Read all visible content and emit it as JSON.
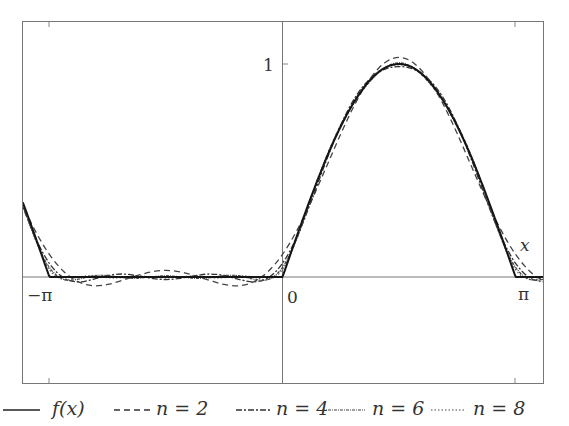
{
  "chart_data": {
    "type": "line",
    "title": "",
    "xlabel": "x",
    "ylabel": "",
    "function": "f(x) = max(sin x, 0) (half-wave rectified sine), Fourier partial sums S_n",
    "xlim": [
      -3.5,
      3.53
    ],
    "ylim": [
      -0.5,
      1.2
    ],
    "grid": false,
    "legend_position": "bottom",
    "x_ticks": [
      {
        "value": -3.14159,
        "label": "−π"
      },
      {
        "value": 0,
        "label": "0"
      },
      {
        "value": 3.14159,
        "label": "π"
      }
    ],
    "y_ticks": [
      {
        "value": 1,
        "label": "1"
      }
    ],
    "x": [
      -3.5343,
      -3.3379,
      -3.1416,
      -2.9452,
      -2.7489,
      -2.5525,
      -2.3562,
      -2.1598,
      -1.9635,
      -1.7671,
      -1.5708,
      -1.3744,
      -1.1781,
      -0.9817,
      -0.7854,
      -0.589,
      -0.3927,
      -0.1963,
      0,
      0.1963,
      0.3927,
      0.589,
      0.7854,
      0.9817,
      1.1781,
      1.3744,
      1.5708,
      1.7671,
      1.9635,
      2.1598,
      2.3562,
      2.5525,
      2.7489,
      2.9452,
      3.1416,
      3.3379,
      3.5343
    ],
    "series": [
      {
        "name": "f(x)",
        "style": "solid",
        "values": [
          0.383,
          0.195,
          0,
          0,
          0,
          0,
          0,
          0,
          0,
          0,
          0,
          0,
          0,
          0,
          0,
          0,
          0,
          0,
          0,
          0.195,
          0.383,
          0.556,
          0.707,
          0.831,
          0.924,
          0.981,
          1.0,
          0.981,
          0.924,
          0.831,
          0.707,
          0.556,
          0.383,
          0.195,
          0,
          0,
          0
        ]
      },
      {
        "name": "n = 2",
        "style": "dashed",
        "values": [
          0.36,
          0.22,
          0.106,
          0.025,
          -0.023,
          -0.041,
          -0.035,
          -0.016,
          0.006,
          0.024,
          0.031,
          0.024,
          0.006,
          -0.016,
          -0.035,
          -0.041,
          -0.023,
          0.025,
          0.106,
          0.22,
          0.36,
          0.515,
          0.672,
          0.815,
          0.93,
          1.005,
          1.031,
          1.005,
          0.93,
          0.815,
          0.672,
          0.515,
          0.36,
          0.22,
          0.106,
          0.025,
          -0.023
        ]
      },
      {
        "name": "n = 4",
        "style": "dash-dot",
        "values": [
          0.36,
          0.19,
          0.064,
          -0.005,
          -0.023,
          -0.011,
          0.007,
          0.014,
          0.006,
          -0.006,
          -0.012,
          -0.006,
          0.006,
          0.014,
          0.007,
          -0.011,
          -0.023,
          -0.005,
          0.064,
          0.19,
          0.36,
          0.545,
          0.714,
          0.845,
          0.93,
          0.975,
          0.988,
          0.975,
          0.93,
          0.845,
          0.714,
          0.545,
          0.36,
          0.19,
          0.064,
          -0.005,
          -0.023
        ]
      },
      {
        "name": "n = 6",
        "style": "dense-dotted",
        "values": [
          0.372,
          0.183,
          0.045,
          -0.012,
          -0.01,
          0.006,
          0.007,
          -0.003,
          -0.006,
          0.001,
          0.006,
          0.001,
          -0.006,
          -0.003,
          0.007,
          0.006,
          -0.01,
          -0.012,
          0.045,
          0.183,
          0.372,
          0.562,
          0.714,
          0.828,
          0.917,
          0.982,
          1.006,
          0.982,
          0.917,
          0.828,
          0.714,
          0.562,
          0.372,
          0.183,
          0.045,
          -0.012,
          -0.01
        ]
      },
      {
        "name": "n = 8",
        "style": "dotted",
        "values": [
          0.383,
          0.183,
          0.035,
          -0.012,
          0.0,
          0.006,
          -0.003,
          -0.003,
          0.004,
          0.001,
          -0.004,
          0.001,
          0.004,
          -0.003,
          -0.003,
          0.006,
          0.0,
          -0.012,
          0.035,
          0.183,
          0.383,
          0.562,
          0.704,
          0.828,
          0.928,
          0.982,
          0.996,
          0.982,
          0.928,
          0.828,
          0.704,
          0.562,
          0.383,
          0.183,
          0.035,
          -0.012,
          0.0
        ]
      }
    ]
  },
  "axes": {
    "x_label": "x",
    "tick_neg_pi": "−π",
    "tick_zero": "0",
    "tick_pi": "π",
    "tick_one": "1"
  },
  "legend": {
    "items": [
      {
        "label": "f(x)",
        "style": "solid"
      },
      {
        "label": "n = 2",
        "style": "dashed"
      },
      {
        "label": "n = 4",
        "style": "dash-dot"
      },
      {
        "label": "n = 6",
        "style": "dense-dotted"
      },
      {
        "label": "n = 8",
        "style": "dotted"
      }
    ]
  },
  "colors": {
    "line": "#1a1a1a",
    "frame": "#777777",
    "text": "#333333"
  }
}
